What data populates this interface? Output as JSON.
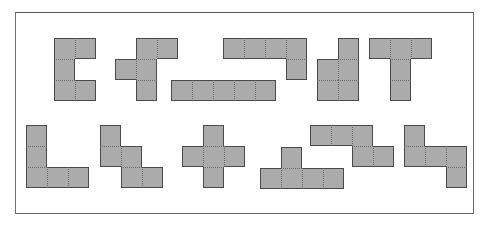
{
  "figure": {
    "cell_size_px": 21,
    "fill_color": "#ababab",
    "outline_color": "#4a4a4a",
    "frame_color": "#6e6e6e"
  },
  "pieces": [
    {
      "name": "U",
      "x": 54,
      "y": 38,
      "cells": [
        [
          0,
          0
        ],
        [
          1,
          0
        ],
        [
          0,
          1
        ],
        [
          0,
          2
        ],
        [
          1,
          2
        ]
      ]
    },
    {
      "name": "F",
      "x": 115,
      "y": 38,
      "cells": [
        [
          1,
          0
        ],
        [
          2,
          0
        ],
        [
          0,
          1
        ],
        [
          1,
          1
        ],
        [
          1,
          2
        ]
      ]
    },
    {
      "name": "I",
      "x": 171,
      "y": 80,
      "cells": [
        [
          0,
          0
        ],
        [
          1,
          0
        ],
        [
          2,
          0
        ],
        [
          3,
          0
        ],
        [
          4,
          0
        ]
      ]
    },
    {
      "name": "L",
      "x": 223,
      "y": 38,
      "cells": [
        [
          0,
          0
        ],
        [
          1,
          0
        ],
        [
          2,
          0
        ],
        [
          3,
          0
        ],
        [
          3,
          1
        ]
      ]
    },
    {
      "name": "P",
      "x": 317,
      "y": 38,
      "cells": [
        [
          1,
          0
        ],
        [
          0,
          1
        ],
        [
          1,
          1
        ],
        [
          0,
          2
        ],
        [
          1,
          2
        ]
      ]
    },
    {
      "name": "T",
      "x": 369,
      "y": 38,
      "cells": [
        [
          0,
          0
        ],
        [
          1,
          0
        ],
        [
          2,
          0
        ],
        [
          1,
          1
        ],
        [
          1,
          2
        ]
      ]
    },
    {
      "name": "V",
      "x": 26,
      "y": 125,
      "cells": [
        [
          0,
          0
        ],
        [
          0,
          1
        ],
        [
          0,
          2
        ],
        [
          1,
          2
        ],
        [
          2,
          2
        ]
      ]
    },
    {
      "name": "W",
      "x": 100,
      "y": 125,
      "cells": [
        [
          0,
          0
        ],
        [
          0,
          1
        ],
        [
          1,
          1
        ],
        [
          1,
          2
        ],
        [
          2,
          2
        ]
      ]
    },
    {
      "name": "X",
      "x": 182,
      "y": 125,
      "cells": [
        [
          1,
          0
        ],
        [
          0,
          1
        ],
        [
          1,
          1
        ],
        [
          2,
          1
        ],
        [
          1,
          2
        ]
      ]
    },
    {
      "name": "Y",
      "x": 260,
      "y": 147,
      "cells": [
        [
          1,
          0
        ],
        [
          0,
          1
        ],
        [
          1,
          1
        ],
        [
          2,
          1
        ],
        [
          3,
          1
        ]
      ]
    },
    {
      "name": "N",
      "x": 310,
      "y": 125,
      "cells": [
        [
          0,
          0
        ],
        [
          1,
          0
        ],
        [
          2,
          0
        ],
        [
          2,
          1
        ],
        [
          3,
          1
        ]
      ]
    },
    {
      "name": "Z",
      "x": 404,
      "y": 125,
      "cells": [
        [
          0,
          0
        ],
        [
          0,
          1
        ],
        [
          1,
          1
        ],
        [
          2,
          1
        ],
        [
          2,
          2
        ]
      ]
    }
  ]
}
